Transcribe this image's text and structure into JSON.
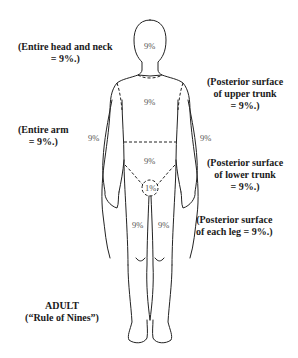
{
  "figure": {
    "title": "ADULT",
    "subtitle": "(“Rule of Nines”)"
  },
  "annotations": {
    "head": {
      "line1": "(Entire head and neck",
      "line2": "= 9%.)"
    },
    "arm": {
      "line1": "(Entire arm",
      "line2": "= 9%.)"
    },
    "upper_trunk": {
      "line1": "(Posterior surface",
      "line2": "of upper trunk",
      "line3": "= 9%.)"
    },
    "lower_trunk": {
      "line1": "(Posterior surface",
      "line2": "of lower trunk",
      "line3": "= 9%.)"
    },
    "leg": {
      "line1": "(Posterior surface",
      "line2": "of each leg = 9%.)"
    }
  },
  "body_labels": {
    "head": "9%",
    "upper_trunk": "9%",
    "lower_trunk": "9%",
    "left_arm": "9%",
    "right_arm": "9%",
    "perineum": "1%",
    "left_leg": "9%",
    "right_leg": "9%"
  },
  "colors": {
    "outline": "#222222",
    "text": "#1a1a1a",
    "percent_text": "#555555",
    "background": "#ffffff"
  }
}
